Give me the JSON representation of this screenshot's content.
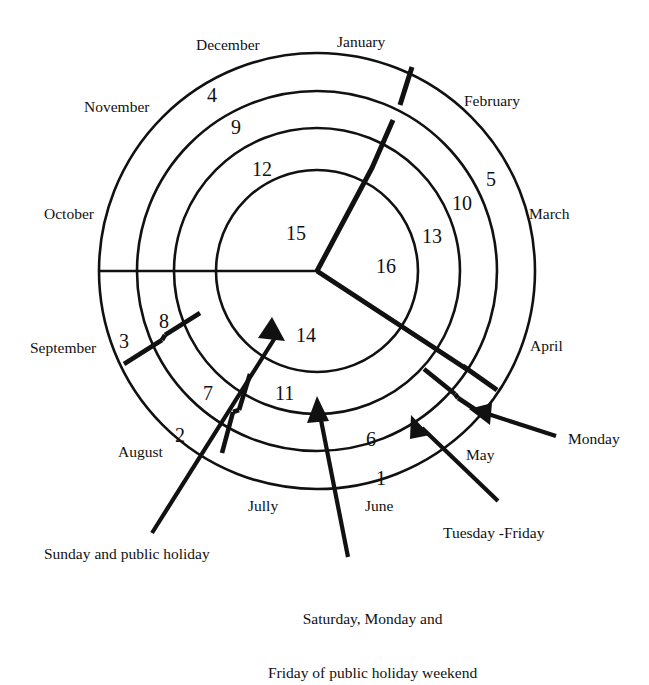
{
  "diagram": {
    "type": "concentric-ring-calendar",
    "center": {
      "x": 317,
      "y": 271
    },
    "ring_radii": [
      218,
      180,
      143,
      101
    ],
    "stroke_color": "#111111",
    "background_color": "#ffffff"
  },
  "months": [
    {
      "name": "January",
      "x": 337,
      "y": 33,
      "align": "left"
    },
    {
      "name": "February",
      "x": 464,
      "y": 92,
      "align": "left"
    },
    {
      "name": "March",
      "x": 529,
      "y": 205,
      "align": "left"
    },
    {
      "name": "April",
      "x": 530,
      "y": 337,
      "align": "left"
    },
    {
      "name": "May",
      "x": 466,
      "y": 446,
      "align": "left"
    },
    {
      "name": "June",
      "x": 365,
      "y": 497,
      "align": "left"
    },
    {
      "name": "Jully",
      "x": 248,
      "y": 497,
      "align": "left"
    },
    {
      "name": "August",
      "x": 118,
      "y": 443,
      "align": "left"
    },
    {
      "name": "September",
      "x": 30,
      "y": 339,
      "align": "left"
    },
    {
      "name": "October",
      "x": 44,
      "y": 205,
      "align": "left"
    },
    {
      "name": "November",
      "x": 84,
      "y": 98,
      "align": "left"
    },
    {
      "name": "December",
      "x": 196,
      "y": 36,
      "align": "left"
    }
  ],
  "ring_numbers": [
    {
      "value": "4",
      "x": 207,
      "y": 84,
      "ring": 1
    },
    {
      "value": "9",
      "x": 231,
      "y": 116,
      "ring": 2
    },
    {
      "value": "12",
      "x": 252,
      "y": 158,
      "ring": 3
    },
    {
      "value": "15",
      "x": 286,
      "y": 222,
      "ring": 4
    },
    {
      "value": "16",
      "x": 376,
      "y": 255,
      "ring": 4
    },
    {
      "value": "13",
      "x": 422,
      "y": 225,
      "ring": 3
    },
    {
      "value": "10",
      "x": 452,
      "y": 192,
      "ring": 2
    },
    {
      "value": "5",
      "x": 486,
      "y": 168,
      "ring": 1
    },
    {
      "value": "14",
      "x": 296,
      "y": 324,
      "ring": 4
    },
    {
      "value": "11",
      "x": 275,
      "y": 382,
      "ring": 3
    },
    {
      "value": "6",
      "x": 366,
      "y": 428,
      "ring": 3
    },
    {
      "value": "1",
      "x": 376,
      "y": 467,
      "ring": 2
    },
    {
      "value": "2",
      "x": 175,
      "y": 424,
      "ring": 1
    },
    {
      "value": "7",
      "x": 203,
      "y": 382,
      "ring": 2
    },
    {
      "value": "3",
      "x": 119,
      "y": 330,
      "ring": 1
    },
    {
      "value": "8",
      "x": 159,
      "y": 310,
      "ring": 2
    }
  ],
  "callouts": [
    {
      "id": "sunday",
      "text": "Sunday and public holiday",
      "x": 44,
      "y": 545,
      "lines": [
        "Sunday and public holiday"
      ]
    },
    {
      "id": "saturday",
      "text": "Saturday, Monday and Friday of public holiday weekend",
      "x": 268,
      "y": 573,
      "lines": [
        "Saturday, Monday and",
        "Friday of public holiday weekend"
      ]
    },
    {
      "id": "tuesday-friday",
      "text": "Tuesday -Friday",
      "x": 443,
      "y": 524,
      "lines": [
        "Tuesday -Friday"
      ]
    },
    {
      "id": "monday",
      "text": "Monday",
      "x": 568,
      "y": 430,
      "lines": [
        "Monday"
      ]
    }
  ]
}
